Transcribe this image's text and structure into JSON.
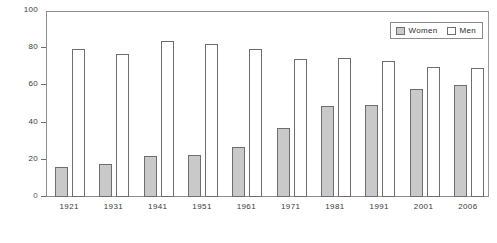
{
  "chart_data": {
    "type": "bar",
    "title": "",
    "subtitle": "",
    "xlabel": "",
    "ylabel": "",
    "categories": [
      "1921",
      "1931",
      "1941",
      "1951",
      "1961",
      "1971",
      "1981",
      "1991",
      "2001",
      "2006"
    ],
    "series": [
      {
        "name": "Women",
        "color": "#c9c9c9",
        "values": [
          16,
          18,
          22,
          22.5,
          27,
          37,
          49,
          49.5,
          58,
          60
        ]
      },
      {
        "name": "Men",
        "color": "#ffffff",
        "values": [
          79.5,
          77,
          84,
          82.5,
          79.5,
          74,
          75,
          73,
          70,
          69.5
        ]
      }
    ],
    "ylim": [
      0,
      100
    ],
    "yticks": [
      0,
      20,
      40,
      60,
      80,
      100
    ],
    "ytick_labels": [
      "0",
      "20",
      "40",
      "60",
      "80",
      "100"
    ],
    "grid": false,
    "legend_position": "top-right",
    "legend_entries": [
      "Women",
      "Men"
    ]
  }
}
